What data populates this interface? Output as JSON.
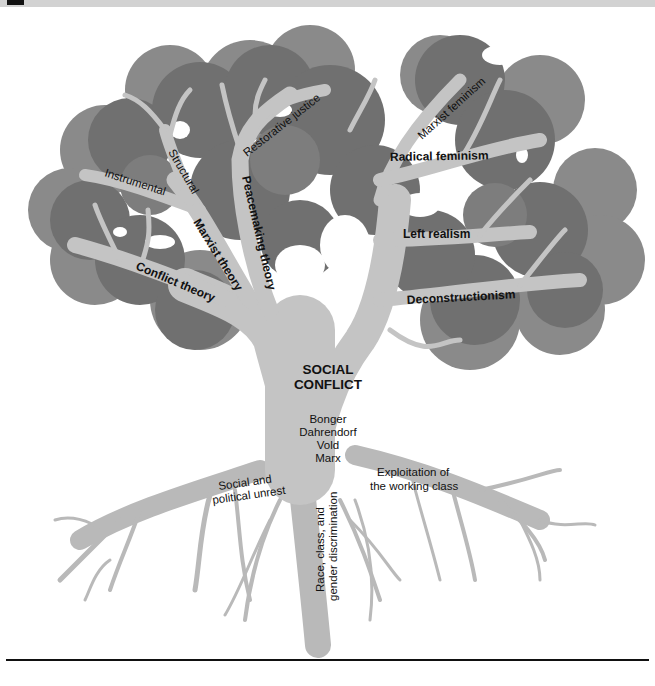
{
  "figure": {
    "colors": {
      "canopy_dark": "#6f6f6f",
      "canopy_mid": "#858585",
      "canopy_light": "#9a9a9a",
      "branch": "#c4c4c4",
      "branch_edge": "#adadad",
      "text": "#111111",
      "rule": "#111111",
      "header_band": "#d2d2d2"
    },
    "trunk": {
      "title_line1": "SOCIAL",
      "title_line2": "CONFLICT",
      "theorists": [
        "Bonger",
        "Dahrendorf",
        "Vold",
        "Marx"
      ]
    },
    "branches": {
      "left": [
        {
          "label": "Conflict theory",
          "weight": "bold"
        },
        {
          "label": "Marxist theory",
          "weight": "bold"
        },
        {
          "label": "Instrumental",
          "weight": "regular"
        },
        {
          "label": "Structural",
          "weight": "regular"
        },
        {
          "label": "Peacemaking theory",
          "weight": "bold"
        },
        {
          "label": "Restorative justice",
          "weight": "regular"
        }
      ],
      "right": [
        {
          "label": "Marxist feminism",
          "weight": "regular"
        },
        {
          "label": "Radical feminism",
          "weight": "bold"
        },
        {
          "label": "Left realism",
          "weight": "bold"
        },
        {
          "label": "Deconstructionism",
          "weight": "bold"
        }
      ]
    },
    "roots": [
      {
        "line1": "Social and",
        "line2": "political unrest"
      },
      {
        "line1": "Race, class, and",
        "line2": "gender discrimination"
      },
      {
        "line1": "Exploitation of",
        "line2": "the working class"
      }
    ]
  }
}
